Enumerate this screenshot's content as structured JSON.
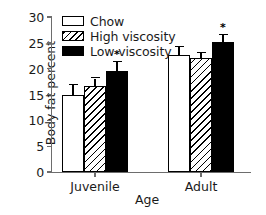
{
  "chart_data": {
    "type": "bar",
    "title": "",
    "xlabel": "Age",
    "ylabel": "Body fat percent",
    "categories": [
      "Juvenile",
      "Adult"
    ],
    "ylim": [
      0,
      30
    ],
    "yticks": [
      0,
      5,
      10,
      15,
      20,
      25,
      30
    ],
    "grid": false,
    "legend_position": "top-left",
    "series": [
      {
        "name": "Chow",
        "fill": "white",
        "values": [
          15.0,
          22.7
        ],
        "errors": [
          1.8,
          1.5
        ],
        "significant": [
          false,
          false
        ]
      },
      {
        "name": "High viscosity",
        "fill": "hatched",
        "values": [
          16.7,
          22.0
        ],
        "errors": [
          1.4,
          1.0
        ],
        "significant": [
          false,
          false
        ]
      },
      {
        "name": "Low viscosity",
        "fill": "black",
        "values": [
          19.6,
          25.2
        ],
        "errors": [
          1.6,
          1.3
        ],
        "significant": [
          true,
          true
        ]
      }
    ],
    "significance_marker": "*",
    "colors": {
      "axis": "#6d6d6d",
      "bar_outline": "#000000",
      "chow": "#ffffff",
      "low_viscosity": "#000000",
      "text": "#1a1a1a",
      "background": "#ffffff"
    }
  }
}
